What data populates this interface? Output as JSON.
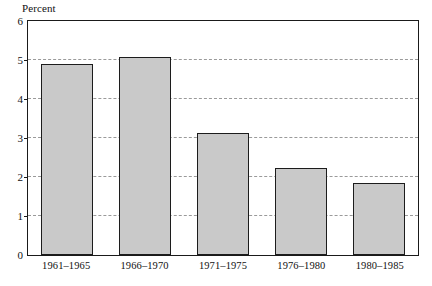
{
  "chart_data": {
    "type": "bar",
    "title": "",
    "subtitle": "",
    "xlabel": "",
    "ylabel": "Percent",
    "categories": [
      "1961–1965",
      "1966–1970",
      "1971–1975",
      "1976–1980",
      "1980–1985"
    ],
    "values": [
      4.9,
      5.07,
      3.12,
      2.22,
      1.85
    ],
    "ylim": [
      0,
      6
    ],
    "y_ticks": [
      0,
      1,
      2,
      3,
      4,
      5,
      6
    ],
    "y_tick_labels": [
      "0",
      "1",
      "2",
      "3",
      "4",
      "5",
      "6"
    ],
    "grid": true,
    "grid_axis": "y",
    "grid_style": "dashed",
    "legend": null,
    "legend_position": "none",
    "annotations": [],
    "bar_fill_color": "#c9c9c9",
    "bar_edge_color": "#1c1c1c",
    "frame_color": "#1a1a1a",
    "grid_color": "#9a9a9a",
    "text_color": "#111111"
  }
}
